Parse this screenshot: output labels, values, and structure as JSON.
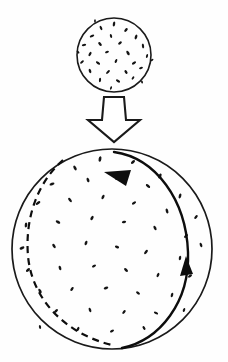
{
  "figure": {
    "background_color": "#ffffff",
    "ink_color": "#141414",
    "canvas": {
      "width": 228,
      "height": 362
    }
  },
  "small_sphere": {
    "label": "small speckled sphere",
    "center_x": 114,
    "center_y": 55,
    "radius": 37,
    "stroke_width": 1.6,
    "specks": [
      [
        114,
        24,
        1.2,
        2.6,
        10
      ],
      [
        101,
        28,
        1.1,
        2.3,
        -25
      ],
      [
        126,
        30,
        1.3,
        2.2,
        40
      ],
      [
        92,
        36,
        1.2,
        2.4,
        65
      ],
      [
        111,
        36,
        1.1,
        2.0,
        -15
      ],
      [
        136,
        37,
        1.2,
        2.5,
        20
      ],
      [
        84,
        45,
        1.1,
        2.2,
        80
      ],
      [
        100,
        44,
        1.3,
        2.3,
        -40
      ],
      [
        120,
        43,
        1.2,
        2.1,
        55
      ],
      [
        143,
        46,
        1.1,
        2.4,
        -10
      ],
      [
        90,
        54,
        1.2,
        2.3,
        30
      ],
      [
        107,
        52,
        1.1,
        2.0,
        70
      ],
      [
        128,
        53,
        1.3,
        2.5,
        -30
      ],
      [
        147,
        56,
        1.0,
        2.0,
        15
      ],
      [
        82,
        62,
        1.1,
        2.2,
        50
      ],
      [
        98,
        63,
        1.2,
        2.4,
        -55
      ],
      [
        116,
        61,
        1.1,
        2.1,
        25
      ],
      [
        134,
        63,
        1.2,
        2.3,
        60
      ],
      [
        90,
        71,
        1.2,
        2.2,
        -20
      ],
      [
        108,
        72,
        1.1,
        2.4,
        45
      ],
      [
        126,
        72,
        1.2,
        2.1,
        -35
      ],
      [
        141,
        68,
        1.0,
        2.0,
        75
      ],
      [
        100,
        80,
        1.1,
        2.2,
        5
      ],
      [
        118,
        81,
        1.2,
        2.3,
        -60
      ],
      [
        133,
        78,
        1.0,
        1.9,
        35
      ],
      [
        95,
        21,
        0.9,
        1.8,
        0
      ],
      [
        152,
        60,
        0.9,
        1.7,
        50
      ],
      [
        78,
        52,
        0.9,
        1.8,
        -45
      ],
      [
        111,
        88,
        0.9,
        1.8,
        20
      ],
      [
        142,
        82,
        0.9,
        1.6,
        -15
      ]
    ]
  },
  "transform_arrow": {
    "label": "downward block arrow",
    "direction": "down",
    "points": "104,97 124,97 126,120 140,120 114,142 88,120 102,120",
    "fill_color": "#ffffff",
    "stroke_color": "#1a1a1a"
  },
  "large_sphere": {
    "label": "large speckled sphere",
    "center_x": 112,
    "center_y": 249,
    "radius": 100,
    "stroke_width": 1.7,
    "specks": [
      [
        100,
        159,
        1.4,
        2.8,
        10
      ],
      [
        75,
        168,
        1.3,
        2.6,
        -30
      ],
      [
        133,
        162,
        1.3,
        2.5,
        45
      ],
      [
        160,
        176,
        1.4,
        2.7,
        20
      ],
      [
        52,
        184,
        1.3,
        2.6,
        70
      ],
      [
        88,
        180,
        1.3,
        2.4,
        -20
      ],
      [
        117,
        178,
        1.2,
        2.3,
        35
      ],
      [
        148,
        186,
        1.3,
        2.6,
        -50
      ],
      [
        180,
        196,
        1.3,
        2.5,
        15
      ],
      [
        38,
        203,
        1.3,
        2.7,
        55
      ],
      [
        70,
        200,
        1.3,
        2.5,
        -40
      ],
      [
        103,
        197,
        1.3,
        2.4,
        25
      ],
      [
        134,
        203,
        1.2,
        2.3,
        60
      ],
      [
        167,
        211,
        1.3,
        2.6,
        -15
      ],
      [
        196,
        217,
        1.2,
        2.3,
        40
      ],
      [
        26,
        225,
        1.3,
        2.6,
        5
      ],
      [
        58,
        222,
        1.3,
        2.5,
        -60
      ],
      [
        92,
        218,
        1.3,
        2.4,
        30
      ],
      [
        124,
        222,
        1.2,
        2.2,
        75
      ],
      [
        155,
        228,
        1.3,
        2.5,
        -25
      ],
      [
        186,
        236,
        1.2,
        2.4,
        50
      ],
      [
        22,
        248,
        1.3,
        2.6,
        65
      ],
      [
        54,
        246,
        1.3,
        2.4,
        -35
      ],
      [
        86,
        243,
        1.3,
        2.3,
        20
      ],
      [
        117,
        247,
        1.2,
        2.2,
        -70
      ],
      [
        146,
        252,
        1.3,
        2.5,
        40
      ],
      [
        180,
        258,
        1.2,
        2.3,
        10
      ],
      [
        201,
        245,
        1.2,
        2.3,
        -20
      ],
      [
        28,
        270,
        1.3,
        2.5,
        45
      ],
      [
        60,
        268,
        1.3,
        2.4,
        -15
      ],
      [
        94,
        266,
        1.2,
        2.2,
        60
      ],
      [
        126,
        270,
        1.3,
        2.4,
        -45
      ],
      [
        158,
        275,
        1.2,
        2.3,
        25
      ],
      [
        190,
        276,
        1.2,
        2.3,
        55
      ],
      [
        40,
        291,
        1.3,
        2.5,
        -30
      ],
      [
        72,
        289,
        1.2,
        2.3,
        35
      ],
      [
        106,
        288,
        1.3,
        2.4,
        70
      ],
      [
        138,
        293,
        1.2,
        2.2,
        -55
      ],
      [
        172,
        295,
        1.2,
        2.3,
        15
      ],
      [
        56,
        311,
        1.2,
        2.4,
        50
      ],
      [
        90,
        310,
        1.2,
        2.3,
        -20
      ],
      [
        124,
        312,
        1.2,
        2.2,
        40
      ],
      [
        156,
        313,
        1.2,
        2.3,
        -65
      ],
      [
        78,
        329,
        1.2,
        2.3,
        25
      ],
      [
        112,
        331,
        1.2,
        2.2,
        60
      ],
      [
        144,
        328,
        1.1,
        2.1,
        -35
      ],
      [
        184,
        310,
        1.1,
        2.1,
        20
      ],
      [
        40,
        327,
        1.1,
        2.0,
        -10
      ]
    ]
  },
  "orbits": {
    "front_orbit": {
      "label": "solid great-circle orbit (front)",
      "style": "solid",
      "path": "M 114 152 C 156 158 186 200 188 252 C 190 302 160 340 122 348",
      "stroke_color": "#0d0d0d"
    },
    "back_orbit": {
      "label": "dashed great-circle orbit (back)",
      "style": "dashed",
      "path": "M 63 160 C 36 184 25 220 28 256 C 32 300 66 334 112 345",
      "stroke_color": "#0d0d0d"
    },
    "arrowheads": [
      {
        "label": "top-left-pointing arrowhead on solid orbit",
        "points": "104,172 131,170 126,186",
        "direction": "up-left"
      },
      {
        "label": "upward-pointing arrowhead on solid orbit",
        "points": "186,256 180,276 193,274",
        "direction": "up"
      }
    ]
  }
}
